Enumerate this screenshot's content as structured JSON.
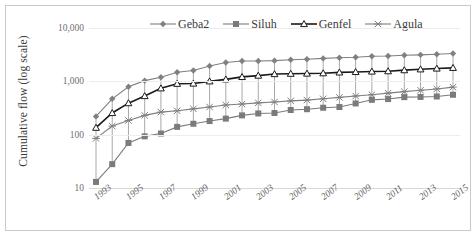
{
  "chart_data": {
    "type": "line",
    "title": "",
    "xlabel": "",
    "ylabel": "Cumulative flow (log scale)",
    "y_scale": "log",
    "ylim": [
      10,
      10000
    ],
    "y_ticks": [
      "10",
      "100",
      "1,000",
      "10,000"
    ],
    "y_tick_values": [
      10,
      100,
      1000,
      10000
    ],
    "grid": true,
    "legend_position": "top",
    "x": [
      1993,
      1994,
      1995,
      1996,
      1997,
      1998,
      1999,
      2000,
      2001,
      2002,
      2003,
      2004,
      2005,
      2006,
      2007,
      2008,
      2009,
      2010,
      2011,
      2012,
      2013,
      2014,
      2015
    ],
    "x_tick_labels": [
      "1993",
      "1995",
      "1997",
      "1999",
      "2001",
      "2003",
      "2005",
      "2007",
      "2009",
      "2011",
      "2013",
      "2015"
    ],
    "x_tick_values": [
      1993,
      1995,
      1997,
      1999,
      2001,
      2003,
      2005,
      2007,
      2009,
      2011,
      2013,
      2015
    ],
    "series": [
      {
        "name": "Geba2",
        "marker": "diamond",
        "color": "#808080",
        "values": [
          220,
          470,
          790,
          1030,
          1190,
          1480,
          1600,
          1940,
          2260,
          2400,
          2410,
          2440,
          2540,
          2600,
          2690,
          2760,
          2830,
          2950,
          2990,
          3080,
          3140,
          3230,
          3320
        ]
      },
      {
        "name": "Siluh",
        "marker": "square",
        "color": "#7b7b7b",
        "values": [
          13,
          28,
          70,
          93,
          105,
          140,
          160,
          180,
          200,
          230,
          250,
          255,
          290,
          300,
          320,
          330,
          385,
          450,
          465,
          505,
          510,
          520,
          560
        ]
      },
      {
        "name": "Genfel",
        "marker": "triangle-open",
        "color": "#1a1a1a",
        "values": [
          135,
          255,
          390,
          530,
          740,
          900,
          910,
          1000,
          1090,
          1210,
          1280,
          1370,
          1390,
          1400,
          1420,
          1470,
          1500,
          1530,
          1550,
          1620,
          1680,
          1740,
          1790
        ]
      },
      {
        "name": "Agula",
        "marker": "cross",
        "color": "#7f7f7f",
        "values": [
          85,
          145,
          185,
          230,
          265,
          280,
          305,
          330,
          360,
          375,
          395,
          410,
          430,
          445,
          470,
          500,
          530,
          560,
          600,
          640,
          680,
          720,
          780
        ]
      }
    ]
  },
  "legend": {
    "items": [
      {
        "label": "Geba2"
      },
      {
        "label": "Siluh"
      },
      {
        "label": "Genfel"
      },
      {
        "label": "Agula"
      }
    ]
  }
}
